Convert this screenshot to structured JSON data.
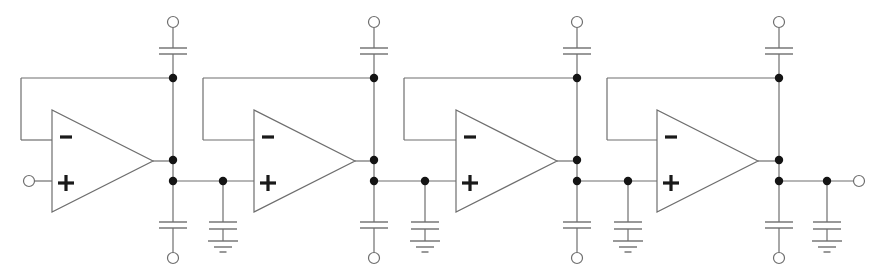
{
  "diagram": {
    "title": "Four-stage cascaded op-amp voltage-follower filter with capacitor coupling",
    "width": 882,
    "height": 280,
    "colors": {
      "wire": "#6e6e6e",
      "node": "#141414",
      "sign": "#1a1a1a",
      "background": "#ffffff"
    },
    "input_terminal": {
      "x": 29,
      "y": 181
    },
    "output_terminal": {
      "x": 859,
      "y": 181
    },
    "stage_count": 4,
    "stages": [
      {
        "index": 1,
        "amp_left": 52,
        "bus_x": 173,
        "loop_left": 21,
        "shunt_x": null,
        "opamp_minus_label": "−",
        "opamp_plus_label": "+"
      },
      {
        "index": 2,
        "amp_left": 254,
        "bus_x": 374,
        "loop_left": 203,
        "shunt_x": 223,
        "opamp_minus_label": "−",
        "opamp_plus_label": "+"
      },
      {
        "index": 3,
        "amp_left": 456,
        "bus_x": 577,
        "loop_left": 404,
        "shunt_x": 425,
        "opamp_minus_label": "−",
        "opamp_plus_label": "+"
      },
      {
        "index": 4,
        "amp_left": 657,
        "bus_x": 779,
        "loop_left": 607,
        "shunt_x": 628,
        "opamp_minus_label": "−",
        "opamp_plus_label": "+"
      }
    ],
    "final_shunt_x": 827,
    "geometry": {
      "amp_top": 110,
      "amp_bottom": 212,
      "amp_width": 101,
      "minus_y": 140,
      "plus_y": 181,
      "top_terminal_y": 22,
      "top_cap_y1": 48,
      "top_cap_y2": 54,
      "feedback_y": 78,
      "out_node_y": 160,
      "low_node_y": 181,
      "bottom_cap_y1": 222,
      "bottom_cap_y2": 228,
      "bottom_terminal_y": 258,
      "shunt_cap_y1": 222,
      "shunt_cap_y2": 229,
      "ground_y": [
        241,
        247,
        252
      ],
      "ground_w": [
        30,
        18,
        7
      ],
      "plate_w": 28
    },
    "components": {
      "opamp": "op-amp",
      "capacitor": "capacitor",
      "ground": "ground",
      "junction": "junction-dot",
      "terminal": "open-terminal"
    }
  }
}
